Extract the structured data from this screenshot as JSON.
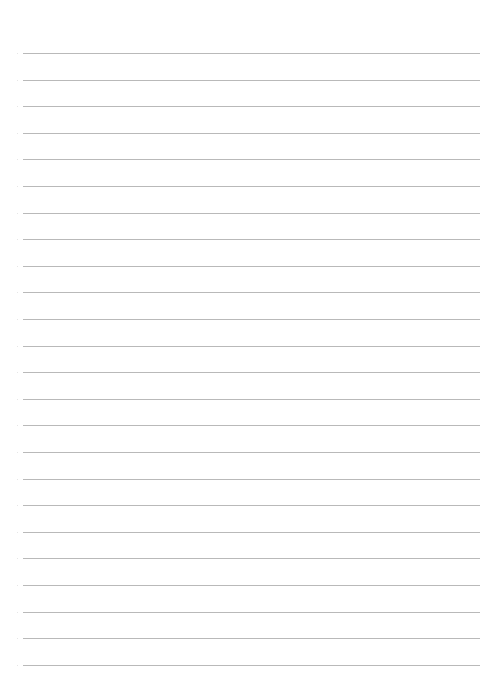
{
  "page": {
    "type": "lined-paper",
    "background_color": "#ffffff",
    "line_color": "#b9b9b9",
    "line_count": 24,
    "first_line_y": 53,
    "line_spacing": 26.6,
    "line_left": 23,
    "line_right": 480
  }
}
